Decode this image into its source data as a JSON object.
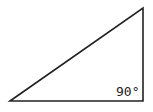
{
  "diagram": {
    "shape": "right-triangle",
    "vertices": [
      [
        10,
        101
      ],
      [
        143,
        8
      ],
      [
        143,
        101
      ]
    ],
    "stroke_color": "#222222",
    "right_angle_label": "90°"
  }
}
